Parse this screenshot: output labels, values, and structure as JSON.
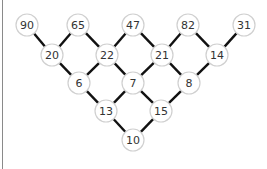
{
  "diagram": {
    "type": "number-pyramid-graph",
    "node_radius": 11,
    "colors": {
      "node_fill": "#ffffff",
      "node_stroke": "#d0d0d0",
      "edge": "#111111",
      "text": "#333333",
      "left_rule": "#8a8a8a"
    },
    "nodes": [
      {
        "id": "n90",
        "label": "90",
        "x": 27,
        "y": 25
      },
      {
        "id": "n65",
        "label": "65",
        "x": 78,
        "y": 25
      },
      {
        "id": "n47",
        "label": "47",
        "x": 133,
        "y": 25
      },
      {
        "id": "n82",
        "label": "82",
        "x": 188,
        "y": 25
      },
      {
        "id": "n31",
        "label": "31",
        "x": 244,
        "y": 25
      },
      {
        "id": "n20",
        "label": "20",
        "x": 52,
        "y": 55
      },
      {
        "id": "n22",
        "label": "22",
        "x": 107,
        "y": 55
      },
      {
        "id": "n21",
        "label": "21",
        "x": 162,
        "y": 55
      },
      {
        "id": "n14",
        "label": "14",
        "x": 217,
        "y": 55
      },
      {
        "id": "n6",
        "label": "6",
        "x": 79,
        "y": 83
      },
      {
        "id": "n7",
        "label": "7",
        "x": 133,
        "y": 83
      },
      {
        "id": "n8",
        "label": "8",
        "x": 189,
        "y": 83
      },
      {
        "id": "n13",
        "label": "13",
        "x": 106,
        "y": 111
      },
      {
        "id": "n15",
        "label": "15",
        "x": 161,
        "y": 111
      },
      {
        "id": "n10",
        "label": "10",
        "x": 133,
        "y": 140
      }
    ],
    "edges": [
      [
        "n90",
        "n20"
      ],
      [
        "n20",
        "n65"
      ],
      [
        "n65",
        "n22"
      ],
      [
        "n22",
        "n47"
      ],
      [
        "n47",
        "n21"
      ],
      [
        "n21",
        "n82"
      ],
      [
        "n82",
        "n14"
      ],
      [
        "n14",
        "n31"
      ],
      [
        "n20",
        "n6"
      ],
      [
        "n6",
        "n22"
      ],
      [
        "n22",
        "n7"
      ],
      [
        "n7",
        "n21"
      ],
      [
        "n21",
        "n8"
      ],
      [
        "n8",
        "n14"
      ],
      [
        "n6",
        "n13"
      ],
      [
        "n13",
        "n7"
      ],
      [
        "n7",
        "n15"
      ],
      [
        "n15",
        "n8"
      ],
      [
        "n13",
        "n10"
      ],
      [
        "n10",
        "n15"
      ]
    ]
  }
}
